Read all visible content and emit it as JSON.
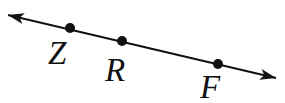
{
  "figure": {
    "background_color": "#ffffff",
    "ink_color": "#111111",
    "canvas": {
      "width": 285,
      "height": 103
    },
    "line": {
      "x1": 8,
      "y1": 15,
      "x2": 276,
      "y2": 78,
      "stroke_width": 2,
      "arrow_both_ends": true,
      "arrow_length": 16,
      "arrow_half_width": 5.5,
      "arrow_notch": 12
    },
    "point_radius": 5,
    "label_font_size": 33,
    "points": [
      {
        "label": "Z",
        "x": 70,
        "y": 28,
        "label_x": 48,
        "label_y": 64
      },
      {
        "label": "R",
        "x": 122,
        "y": 41,
        "label_x": 105,
        "label_y": 81
      },
      {
        "label": "F",
        "x": 218,
        "y": 64,
        "label_x": 200,
        "label_y": 98
      }
    ]
  }
}
